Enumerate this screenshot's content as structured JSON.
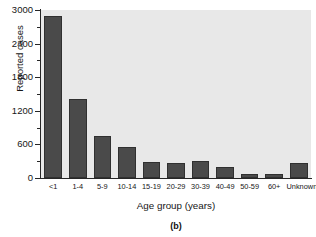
{
  "figure": {
    "caption": "(b)"
  },
  "chart_data": {
    "type": "bar",
    "title": "",
    "xlabel": "Age group (years)",
    "ylabel": "Reported cases",
    "categories": [
      "<1",
      "1-4",
      "5-9",
      "10-14",
      "15-19",
      "20-29",
      "30-39",
      "40-49",
      "50-59",
      "60+",
      "Unknown"
    ],
    "values": [
      2900,
      1410,
      750,
      555,
      290,
      265,
      295,
      190,
      70,
      65,
      275
    ],
    "ylim": [
      0,
      3000
    ],
    "ytick_labels": [
      "0",
      "600",
      "1200",
      "1800",
      "2400",
      "3000"
    ],
    "ytick_values": [
      0,
      600,
      1200,
      1800,
      2400,
      3000
    ],
    "yminor_tick_values": [
      300,
      900,
      1500,
      2100,
      2700
    ],
    "grid": false,
    "legend": null,
    "bar_color": "#4a4a4a",
    "plot_background": "#e8e8e8",
    "figure_background": "#ffffff"
  }
}
